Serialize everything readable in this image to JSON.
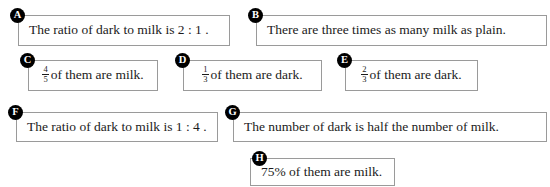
{
  "page": {
    "background_color": "#ffffff",
    "text_color": "#1b1b1b",
    "border_color": "#9a9a9a",
    "badge_color": "#000000",
    "badge_text_color": "#ffffff",
    "clipped_top_line": ""
  },
  "options": [
    {
      "letter": "A",
      "kind": "text",
      "text": "The ratio of dark to milk is 2 : 1 ."
    },
    {
      "letter": "B",
      "kind": "text",
      "text": "There are three times as many milk as plain."
    },
    {
      "letter": "C",
      "kind": "fraction",
      "numerator": "4",
      "denominator": "5",
      "text": "of them are milk."
    },
    {
      "letter": "D",
      "kind": "fraction",
      "numerator": "1",
      "denominator": "3",
      "text": "of them are dark."
    },
    {
      "letter": "E",
      "kind": "fraction",
      "numerator": "2",
      "denominator": "3",
      "text": "of them are dark."
    },
    {
      "letter": "F",
      "kind": "text",
      "text": "The ratio of dark to milk is 1 : 4 ."
    },
    {
      "letter": "G",
      "kind": "text",
      "text": "The number of dark is half the number of milk."
    },
    {
      "letter": "H",
      "kind": "text",
      "text": "75% of them are milk."
    }
  ]
}
